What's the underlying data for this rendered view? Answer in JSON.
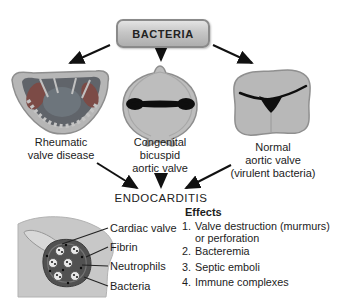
{
  "diagram": {
    "bacteria_box": "BACTERIA",
    "valves": [
      {
        "lines": [
          "Rheumatic",
          "valve disease"
        ]
      },
      {
        "lines": [
          "Congenital",
          "bicuspid",
          "aortic valve"
        ]
      },
      {
        "lines": [
          "Normal",
          "aortic valve",
          "(virulent bacteria)"
        ]
      }
    ],
    "outcome": "ENDOCARDITIS",
    "vegetation": {
      "labels": [
        "Cardiac valve",
        "Fibrin",
        "Neutrophils",
        "Bacteria"
      ]
    },
    "effects": {
      "heading": "Effects",
      "items": [
        {
          "num": "1.",
          "lines": [
            "Valve destruction (murmurs)",
            "or perforation"
          ]
        },
        {
          "num": "2.",
          "lines": [
            "Bacteremia"
          ]
        },
        {
          "num": "3.",
          "lines": [
            "Septic emboli"
          ]
        },
        {
          "num": "4.",
          "lines": [
            "Immune complexes"
          ]
        }
      ]
    },
    "colors": {
      "valve_gray": "#b8b8b8",
      "valve_border": "#8e8e8e",
      "lesion_dark": "#60646a",
      "lesion_red": "#7c4b46",
      "vegetation_dark": "#515151",
      "arrow": "#111111"
    }
  }
}
